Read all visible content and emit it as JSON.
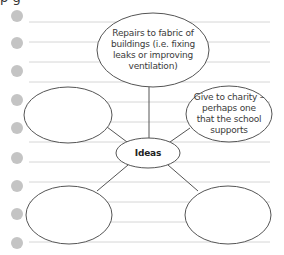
{
  "page": {
    "cropped_heading_fragment": "p        g",
    "ruled_line_color": "#d6d6d6",
    "hole_color": "#c4c4c4",
    "outline_color": "#555555"
  },
  "diagram": {
    "type": "spider-diagram",
    "center": {
      "label": "Ideas"
    },
    "branches": [
      {
        "id": "top",
        "label": "Repairs to fabric of buildings (i.e. fixing leaks or improving ventilation)"
      },
      {
        "id": "right",
        "label": "Give to charity – perhaps one that the school supports"
      },
      {
        "id": "left",
        "label": ""
      },
      {
        "id": "bottom-left",
        "label": ""
      },
      {
        "id": "bottom-right",
        "label": ""
      }
    ]
  }
}
